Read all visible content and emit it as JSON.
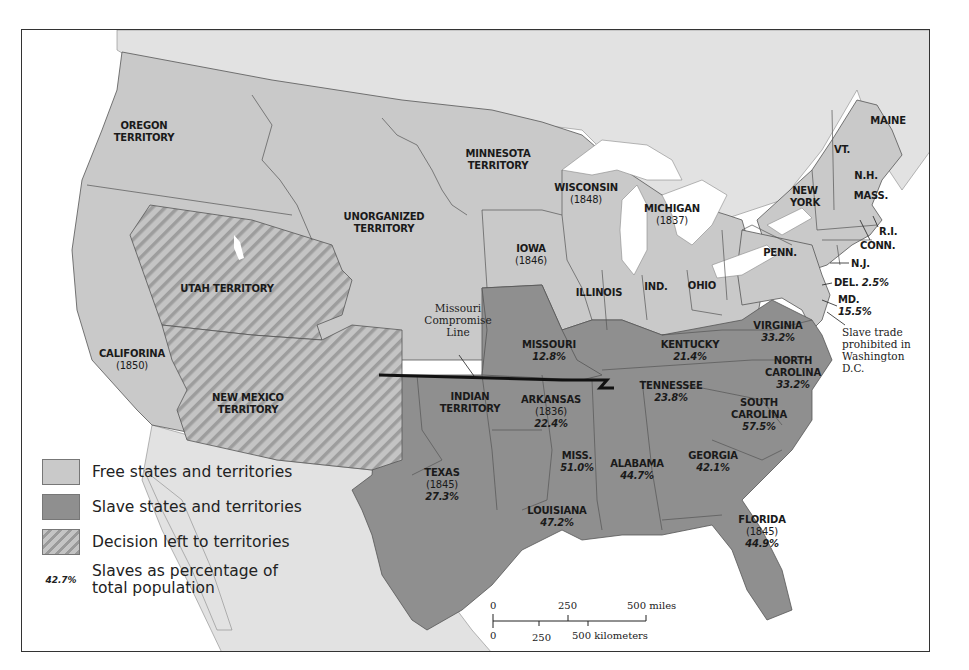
{
  "map": {
    "colors": {
      "free": "#c9c9c9",
      "slave": "#8f8f8f",
      "decision_light": "#c4c4c4",
      "decision_dark": "#9a9a9a",
      "foreign_land": "#e2e2e2",
      "water": "#ffffff",
      "border": "#555555",
      "compromise_line": "#111111"
    },
    "regions": {
      "oregon": {
        "name": "OREGON",
        "line2": "TERRITORY"
      },
      "minnesota": {
        "name": "MINNESOTA",
        "line2": "TERRITORY"
      },
      "unorganized": {
        "name": "UNORGANIZED",
        "line2": "TERRITORY"
      },
      "utah": {
        "name": "UTAH TERRITORY"
      },
      "california": {
        "name": "CALIFORINA",
        "year": "(1850)"
      },
      "new_mexico": {
        "name": "NEW MEXICO",
        "line2": "TERRITORY"
      },
      "wisconsin": {
        "name": "WISCONSIN",
        "year": "(1848)"
      },
      "michigan": {
        "name": "MICHIGAN",
        "year": "(1837)"
      },
      "iowa": {
        "name": "IOWA",
        "year": "(1846)"
      },
      "illinois": {
        "name": "ILLINOIS"
      },
      "indiana": {
        "name": "IND."
      },
      "ohio": {
        "name": "OHIO"
      },
      "penn": {
        "name": "PENN."
      },
      "new_york": {
        "name": "NEW",
        "line2": "YORK"
      },
      "maine": {
        "name": "MAINE"
      },
      "vermont": {
        "name": "VT."
      },
      "new_hampshire": {
        "name": "N.H."
      },
      "massachusetts": {
        "name": "MASS."
      },
      "rhode_island": {
        "name": "R.I."
      },
      "connecticut": {
        "name": "CONN."
      },
      "new_jersey": {
        "name": "N.J."
      },
      "delaware": {
        "name": "DEL.",
        "pct": "2.5%"
      },
      "maryland": {
        "name": "MD.",
        "pct": "15.5%"
      },
      "virginia": {
        "name": "VIRGINIA",
        "pct": "33.2%"
      },
      "north_carolina": {
        "name": "NORTH",
        "line2": "CAROLINA",
        "pct": "33.2%"
      },
      "south_carolina": {
        "name": "SOUTH",
        "line2": "CAROLINA",
        "pct": "57.5%"
      },
      "georgia": {
        "name": "GEORGIA",
        "pct": "42.1%"
      },
      "florida": {
        "name": "FLORIDA",
        "year": "(1845)",
        "pct": "44.9%"
      },
      "alabama": {
        "name": "ALABAMA",
        "pct": "44.7%"
      },
      "mississippi": {
        "name": "MISS.",
        "pct": "51.0%"
      },
      "louisiana": {
        "name": "LOUISIANA",
        "pct": "47.2%"
      },
      "tennessee": {
        "name": "TENNESSEE",
        "pct": "23.8%"
      },
      "kentucky": {
        "name": "KENTUCKY",
        "pct": "21.4%"
      },
      "missouri": {
        "name": "MISSOURI",
        "pct": "12.8%"
      },
      "arkansas": {
        "name": "ARKANSAS",
        "year": "(1836)",
        "pct": "22.4%"
      },
      "indian": {
        "name": "INDIAN",
        "line2": "TERRITORY"
      },
      "texas": {
        "name": "TEXAS",
        "year": "(1845)",
        "pct": "27.3%"
      }
    },
    "annotations": {
      "missouri_compromise": {
        "line1": "Missouri",
        "line2": "Compromise",
        "line3": "Line"
      },
      "dc_slave_trade": {
        "line1": "Slave trade",
        "line2": "prohibited in",
        "line3": "Washington D.C."
      }
    },
    "legend": {
      "free": "Free states and territories",
      "slave": "Slave states and territories",
      "decision": "Decision left to territories",
      "pct_sample": "42.7%",
      "pct_line1": "Slaves as percentage of",
      "pct_line2": "total population"
    },
    "scale_bar": {
      "miles": {
        "t0": "0",
        "t1": "250",
        "t2": "500 miles"
      },
      "km": {
        "t0": "0",
        "t1": "250",
        "t2": "500 kilometers"
      }
    }
  }
}
